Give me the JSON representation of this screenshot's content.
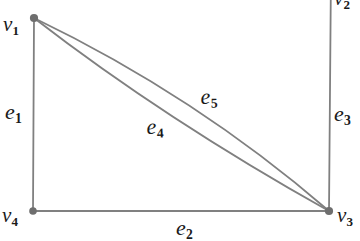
{
  "figure": {
    "kind": "graph-diagram",
    "background_color": "#ffffff",
    "edge_color": "#808080",
    "vertex_color": "#6e6e6e",
    "label_color": "#1a1a1a",
    "width": 360,
    "height": 241
  },
  "vertices": [
    {
      "id": "v1",
      "label": "v",
      "subscript": "1",
      "x": 34,
      "y": 18,
      "label_x": 4,
      "label_y": 18,
      "visible_dot": true,
      "clipped": false
    },
    {
      "id": "v2",
      "label": "v",
      "subscript": "2",
      "x": 330,
      "y": -28,
      "label_x": 334,
      "label_y": -10,
      "visible_dot": false,
      "clipped": true
    },
    {
      "id": "v3",
      "label": "v",
      "subscript": "3",
      "x": 329,
      "y": 211,
      "label_x": 337,
      "label_y": 209,
      "visible_dot": true,
      "clipped": false
    },
    {
      "id": "v4",
      "label": "v",
      "subscript": "4",
      "x": 33,
      "y": 211,
      "label_x": 2,
      "label_y": 209,
      "visible_dot": true,
      "clipped": false
    }
  ],
  "edges": [
    {
      "id": "e1",
      "label": "e",
      "subscript": "1",
      "from": "v1",
      "to": "v4",
      "shape": "line",
      "label_x": 5,
      "label_y": 101
    },
    {
      "id": "e2",
      "label": "e",
      "subscript": "2",
      "from": "v4",
      "to": "v3",
      "shape": "line",
      "label_x": 175,
      "label_y": 217
    },
    {
      "id": "e3",
      "label": "e",
      "subscript": "3",
      "from": "v3",
      "to": "v2",
      "shape": "line",
      "label_x": 334,
      "label_y": 103
    },
    {
      "id": "e4",
      "label": "e",
      "subscript": "4",
      "from": "v1",
      "to": "v3",
      "shape": "curve",
      "label_x": 147,
      "label_y": 116
    },
    {
      "id": "e5",
      "label": "e",
      "subscript": "5",
      "from": "v1",
      "to": "v3",
      "shape": "curve",
      "label_x": 200,
      "label_y": 86
    }
  ]
}
